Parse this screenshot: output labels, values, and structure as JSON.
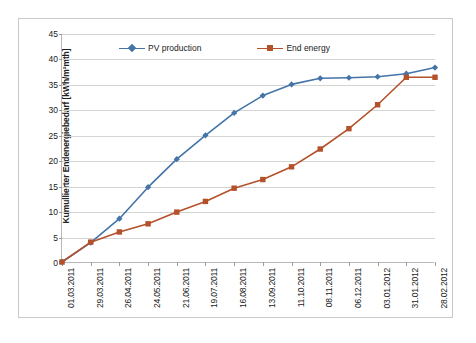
{
  "chart_data": {
    "type": "line",
    "title": "",
    "xlabel": "",
    "ylabel": "Kumullierter Endenergiebedarf [kWh/m²mth]",
    "ylim": [
      0,
      45
    ],
    "ytick_step": 5,
    "yticks": [
      0,
      5,
      10,
      15,
      20,
      25,
      30,
      35,
      40,
      45
    ],
    "grid": true,
    "legend_position": "top-center",
    "categories": [
      "01.03.2011",
      "29.03.2011",
      "26.04.2011",
      "24.05.2011",
      "21.06.2011",
      "19.07.2011",
      "16.08.2011",
      "13.09.2011",
      "11.10.2011",
      "08.11.2011",
      "06.12.2011",
      "03.01.2012",
      "31.01.2012",
      "28.02.2012"
    ],
    "series": [
      {
        "name": "PV production",
        "color": "#4474a8",
        "marker": "diamond",
        "values": [
          0.2,
          4.0,
          8.7,
          14.9,
          20.4,
          25.1,
          29.5,
          32.9,
          35.1,
          36.3,
          36.4,
          36.6,
          37.2,
          38.4
        ]
      },
      {
        "name": "End energy",
        "color": "#b4512a",
        "marker": "square",
        "values": [
          0.2,
          4.1,
          6.1,
          7.7,
          10.0,
          12.1,
          14.7,
          16.4,
          18.9,
          22.4,
          26.4,
          31.1,
          36.5,
          36.5
        ]
      }
    ]
  },
  "legend": {
    "entries": [
      {
        "label": "PV production"
      },
      {
        "label": "End energy"
      }
    ]
  },
  "page_margin": {
    "cutoff_text": ""
  }
}
